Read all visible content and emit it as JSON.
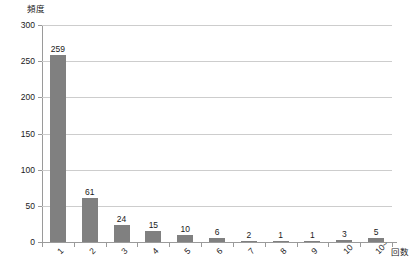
{
  "chart_data": {
    "type": "bar",
    "title": "",
    "subtitle": "",
    "xlabel": "回数",
    "ylabel": "頻度",
    "categories": [
      "1",
      "2",
      "3",
      "4",
      "5",
      "6",
      "7",
      "8",
      "9",
      "10",
      "10~"
    ],
    "values": [
      259,
      61,
      24,
      15,
      10,
      6,
      2,
      1,
      1,
      3,
      5
    ],
    "data_labels": [
      "259",
      "61",
      "24",
      "15",
      "10",
      "6",
      "2",
      "1",
      "1",
      "3",
      "5"
    ],
    "ylim": [
      0,
      300
    ],
    "ytick_labels": [
      "0",
      "50",
      "100",
      "150",
      "200",
      "250",
      "300"
    ],
    "ytick_values": [
      0,
      50,
      100,
      150,
      200,
      250,
      300
    ],
    "grid": "horizontal",
    "legend": "none",
    "series": [
      {
        "name": "頻度",
        "values": [
          259,
          61,
          24,
          15,
          10,
          6,
          2,
          1,
          1,
          3,
          5
        ]
      }
    ],
    "colors": {
      "bar": "#808080",
      "gridline": "#cdcdcd",
      "axis": "#9a9a9a",
      "text": "#1a1a1a",
      "background": "#ffffff"
    }
  }
}
